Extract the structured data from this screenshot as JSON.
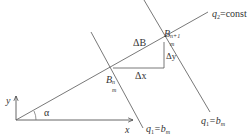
{
  "diagram": {
    "axes": {
      "x_label": "x",
      "y_label": "y",
      "angle_label": "α"
    },
    "lines": {
      "q2_line_label": "q",
      "q2_line_sub": "2",
      "q2_line_value": "=const",
      "q1_left_label": "q",
      "q1_left_sub": "1",
      "q1_left_value": "=b",
      "q1_left_value_sub": "m",
      "q1_right_label": "q",
      "q1_right_sub": "1",
      "q1_right_value": "=b",
      "q1_right_value_sub": "m"
    },
    "points": {
      "point_n_label": "B",
      "point_n_sup": "n",
      "point_n_sub": "m",
      "point_n1_label": "B",
      "point_n1_sup": "n+1",
      "point_n1_sub": "m"
    },
    "deltas": {
      "delta_b": "ΔB",
      "delta_x": "Δx",
      "delta_y": "Δy"
    },
    "colors": {
      "line": "#555555",
      "text": "#333333"
    }
  }
}
